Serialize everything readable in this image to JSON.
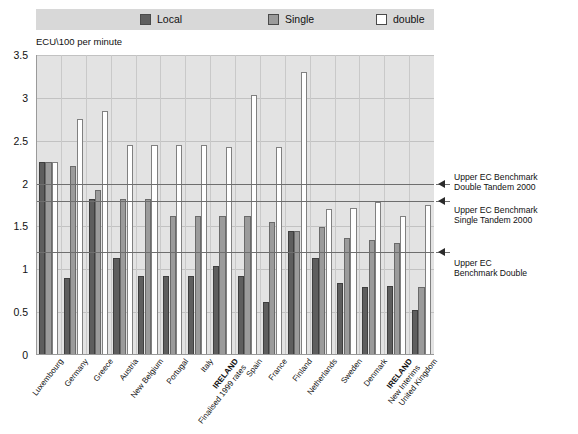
{
  "legend": {
    "items": [
      {
        "label": "Local",
        "color": "#5e5e5e",
        "left": 104
      },
      {
        "label": "Single",
        "color": "#9b9b9b",
        "left": 232
      },
      {
        "label": "double",
        "color": "#ffffff",
        "left": 340
      }
    ]
  },
  "axis_title": "ECU\\100 per minute",
  "annotations": [
    {
      "text_line1": "Upper EC Benchmark",
      "text_line2": "Double Tandem 2000",
      "value": 2.0
    },
    {
      "text_line1": "Upper EC Benchmark",
      "text_line2": "Single Tandem 2000",
      "value": 1.8
    },
    {
      "text_line1": "Upper EC",
      "text_line2": "Benchmark Double",
      "value": 1.2
    }
  ],
  "chart_data": {
    "type": "bar",
    "title": "",
    "subtitle": "",
    "xlabel": "",
    "ylabel": "ECU\\100 per minute",
    "ylim": [
      0,
      3.5
    ],
    "yticks": [
      0,
      0.5,
      1,
      1.5,
      2,
      2.5,
      3,
      3.5
    ],
    "ytick_labels": [
      "0",
      "0.5",
      "1",
      "1.5",
      "2",
      "2.5",
      "3",
      "3.5"
    ],
    "grid": true,
    "legend_position": "top",
    "categories": [
      "Luxembourg",
      "Germany",
      "Greece",
      "Austria",
      "New Belgium",
      "Portugal",
      "Italy",
      "IRELAND Finalised 1999 rates",
      "Spain",
      "France",
      "Finland",
      "Netherlands",
      "Sweden",
      "Denmark",
      "IRELAND New Interims",
      "United Kingdom"
    ],
    "category_lines": [
      {
        "l1": "Luxembourg",
        "l2": "",
        "bold": false
      },
      {
        "l1": "Germany",
        "l2": "",
        "bold": false
      },
      {
        "l1": "Greece",
        "l2": "",
        "bold": false
      },
      {
        "l1": "Austria",
        "l2": "",
        "bold": false
      },
      {
        "l1": "New Belgium",
        "l2": "",
        "bold": false
      },
      {
        "l1": "Portugal",
        "l2": "",
        "bold": false
      },
      {
        "l1": "Italy",
        "l2": "",
        "bold": false
      },
      {
        "l1": "IRELAND",
        "l2": "Finalised 1999 rates",
        "bold": true
      },
      {
        "l1": "Spain",
        "l2": "",
        "bold": false
      },
      {
        "l1": "France",
        "l2": "",
        "bold": false
      },
      {
        "l1": "Finland",
        "l2": "",
        "bold": false
      },
      {
        "l1": "Netherlands",
        "l2": "",
        "bold": false
      },
      {
        "l1": "Sweden",
        "l2": "",
        "bold": false
      },
      {
        "l1": "Denmark",
        "l2": "",
        "bold": false
      },
      {
        "l1": "IRELAND",
        "l2": "New Interims",
        "bold": true
      },
      {
        "l1": "United Kingdom",
        "l2": "",
        "bold": false
      }
    ],
    "series": [
      {
        "name": "Local",
        "color": "#5e5e5e",
        "values": [
          2.25,
          0.9,
          1.82,
          1.13,
          0.92,
          0.92,
          1.04,
          0.92,
          0.62,
          1.45,
          1.13,
          0.84,
          0.79,
          0.8,
          0.52,
          0.0
        ]
      },
      {
        "name": "Single",
        "color": "#9b9b9b",
        "values": [
          2.25,
          2.2,
          1.92,
          1.82,
          1.62,
          1.62,
          1.62,
          1.62,
          2.43,
          1.45,
          1.49,
          1.36,
          1.34,
          1.31,
          0.79,
          0.0
        ]
      },
      {
        "name": "double",
        "color": "#ffffff",
        "values": [
          2.25,
          2.75,
          2.85,
          2.45,
          2.45,
          2.45,
          2.43,
          3.03,
          3.3,
          1.7,
          1.72,
          1.78,
          1.62,
          1.75,
          0.0,
          0.0
        ]
      }
    ],
    "series_by_category": [
      {
        "category": "Luxembourg",
        "local": 2.25,
        "single": 2.25,
        "double": 2.25
      },
      {
        "category": "Germany",
        "local": 0.9,
        "single": 2.2,
        "double": 2.75
      },
      {
        "category": "Greece",
        "local": 1.82,
        "single": 1.92,
        "double": 2.85
      },
      {
        "category": "Austria",
        "local": 1.13,
        "single": 1.82,
        "double": 2.45
      },
      {
        "category": "New Belgium",
        "local": 0.92,
        "single": 1.82,
        "double": 2.45
      },
      {
        "category": "Portugal",
        "local": 0.92,
        "single": 1.62,
        "double": 2.45
      },
      {
        "category": "Italy",
        "local": 0.92,
        "single": 1.62,
        "double": 2.45
      },
      {
        "category": "IRELAND Finalised 1999 rates",
        "local": 1.04,
        "single": 1.62,
        "double": 2.43
      },
      {
        "category": "Spain",
        "local": 0.92,
        "single": 1.62,
        "double": 3.03
      },
      {
        "category": "France",
        "local": 0.62,
        "single": 1.55,
        "double": 2.43
      },
      {
        "category": "Finland",
        "local": 1.45,
        "single": 1.45,
        "double": 3.3
      },
      {
        "category": "Netherlands",
        "local": 1.13,
        "single": 1.49,
        "double": 1.7
      },
      {
        "category": "Sweden",
        "local": 0.84,
        "single": 1.36,
        "double": 1.72
      },
      {
        "category": "Denmark",
        "local": 0.79,
        "single": 1.34,
        "double": 1.78
      },
      {
        "category": "IRELAND New Interims",
        "local": 0.8,
        "single": 1.31,
        "double": 1.62
      },
      {
        "category": "United Kingdom",
        "local": 0.52,
        "single": 0.79,
        "double": 1.75
      }
    ],
    "benchmark_lines": [
      {
        "label": "Upper EC Benchmark Double Tandem 2000",
        "value": 2.0
      },
      {
        "label": "Upper EC Benchmark Single Tandem 2000",
        "value": 1.8
      },
      {
        "label": "Upper EC Benchmark Double",
        "value": 1.2
      }
    ]
  }
}
